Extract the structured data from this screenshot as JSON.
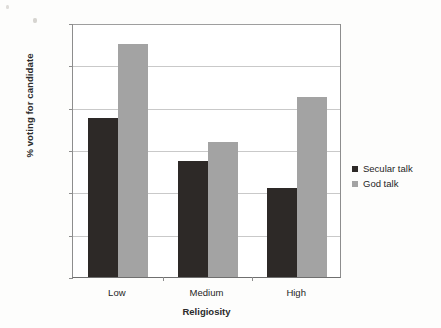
{
  "chart_data": {
    "type": "bar",
    "title": "",
    "xlabel": "Religiosity",
    "ylabel": "% voting for candidate",
    "categories": [
      "Low",
      "Medium",
      "High"
    ],
    "series": [
      {
        "name": "Secular talk",
        "color": "#2d2927",
        "values": [
          37.5,
          27.5,
          21
        ]
      },
      {
        "name": "God talk",
        "color": "#a3a3a3",
        "values": [
          55,
          32,
          42.5
        ]
      }
    ],
    "ylim": [
      0,
      60
    ],
    "ytick_values": [
      60,
      50,
      40,
      30,
      20,
      10,
      0
    ],
    "ytick_labels": [
      "60%",
      "50%",
      "40%",
      "30%",
      "20%",
      "10%",
      "0%"
    ],
    "grid": true,
    "legend_position": "right"
  }
}
